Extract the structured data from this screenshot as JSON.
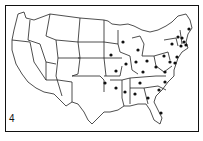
{
  "figure": {
    "panel_label": "4",
    "title": ""
  },
  "map": {
    "region": "Contiguous United States",
    "marker": "black-dot",
    "marked_states": [
      "Maine",
      "New Hampshire",
      "Vermont",
      "Massachusetts",
      "Rhode Island",
      "Connecticut",
      "New York",
      "New Jersey",
      "Pennsylvania",
      "Delaware",
      "Maryland",
      "Virginia",
      "West Virginia",
      "North Carolina",
      "South Carolina",
      "Georgia",
      "Florida",
      "Alabama",
      "Mississippi",
      "Tennessee",
      "Kentucky",
      "Ohio",
      "Indiana",
      "Illinois",
      "Michigan",
      "Wisconsin",
      "Iowa",
      "Missouri",
      "Arkansas",
      "Oklahoma"
    ],
    "dots": [
      {
        "state": "Maine",
        "x": 189,
        "y": 29
      },
      {
        "state": "Vermont",
        "x": 178,
        "y": 37
      },
      {
        "state": "New Hampshire",
        "x": 182,
        "y": 38
      },
      {
        "state": "Massachusetts",
        "x": 184,
        "y": 42
      },
      {
        "state": "Rhode Island",
        "x": 186,
        "y": 45
      },
      {
        "state": "Connecticut",
        "x": 181,
        "y": 46
      },
      {
        "state": "New York",
        "x": 172,
        "y": 44
      },
      {
        "state": "New Jersey",
        "x": 177,
        "y": 57
      },
      {
        "state": "Pennsylvania",
        "x": 164,
        "y": 56
      },
      {
        "state": "Delaware",
        "x": 175,
        "y": 63
      },
      {
        "state": "Maryland",
        "x": 170,
        "y": 62
      },
      {
        "state": "West Virginia",
        "x": 156,
        "y": 67
      },
      {
        "state": "Virginia",
        "x": 165,
        "y": 72
      },
      {
        "state": "North Carolina",
        "x": 165,
        "y": 82
      },
      {
        "state": "South Carolina",
        "x": 159,
        "y": 90
      },
      {
        "state": "Georgia",
        "x": 148,
        "y": 98
      },
      {
        "state": "Florida",
        "x": 161,
        "y": 113
      },
      {
        "state": "Alabama",
        "x": 135,
        "y": 94
      },
      {
        "state": "Mississippi",
        "x": 125,
        "y": 92
      },
      {
        "state": "Tennessee",
        "x": 140,
        "y": 83
      },
      {
        "state": "Kentucky",
        "x": 143,
        "y": 72
      },
      {
        "state": "Ohio",
        "x": 147,
        "y": 61
      },
      {
        "state": "Indiana",
        "x": 136,
        "y": 62
      },
      {
        "state": "Illinois",
        "x": 126,
        "y": 64
      },
      {
        "state": "Michigan",
        "x": 138,
        "y": 50
      },
      {
        "state": "Wisconsin",
        "x": 123,
        "y": 42
      },
      {
        "state": "Iowa",
        "x": 111,
        "y": 55
      },
      {
        "state": "Missouri",
        "x": 116,
        "y": 71
      },
      {
        "state": "Arkansas",
        "x": 116,
        "y": 88
      },
      {
        "state": "Oklahoma",
        "x": 105,
        "y": 83
      }
    ]
  }
}
